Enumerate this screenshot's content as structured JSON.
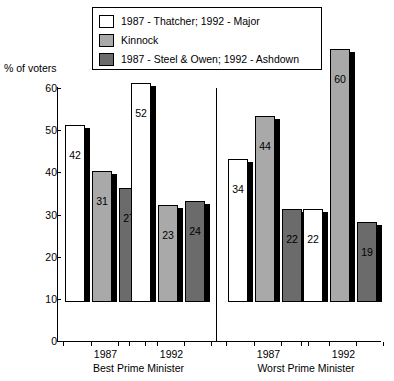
{
  "chart_data": {
    "type": "bar",
    "title": "",
    "subtitle": "",
    "xlabel": "",
    "ylabel": "% of voters",
    "ylim": [
      0,
      60
    ],
    "yticks": [
      0,
      10,
      20,
      30,
      40,
      50,
      60
    ],
    "grid": false,
    "legend_position": "top",
    "legend": [
      {
        "label": "1987 - Thatcher; 1992 - Major",
        "color": "#ffffff",
        "swatch": "sw-white"
      },
      {
        "label": "Kinnock",
        "color": "#a9a9a9",
        "swatch": "sw-light"
      },
      {
        "label": "1987 - Steel & Owen; 1992 - Ashdown",
        "color": "#6b6b6b",
        "swatch": "sw-dark"
      }
    ],
    "series": [
      {
        "name": "1987 - Thatcher; 1992 - Major",
        "values": [
          42,
          52,
          34,
          22
        ]
      },
      {
        "name": "Kinnock",
        "values": [
          31,
          23,
          44,
          60
        ]
      },
      {
        "name": "1987 - Steel & Owen; 1992 - Ashdown",
        "values": [
          27,
          24,
          22,
          19
        ]
      }
    ],
    "panels": [
      {
        "label": "Best Prime Minister",
        "groups": [
          {
            "label": "1987",
            "bars": [
              {
                "series": "1987 - Thatcher; 1992 - Major",
                "value": 42,
                "swatch": "c-white"
              },
              {
                "series": "Kinnock",
                "value": 31,
                "swatch": "c-light"
              },
              {
                "series": "1987 - Steel & Owen; 1992 - Ashdown",
                "value": 27,
                "swatch": "c-dark"
              }
            ]
          },
          {
            "label": "1992",
            "bars": [
              {
                "series": "1987 - Thatcher; 1992 - Major",
                "value": 52,
                "swatch": "c-white"
              },
              {
                "series": "Kinnock",
                "value": 23,
                "swatch": "c-light"
              },
              {
                "series": "1987 - Steel & Owen; 1992 - Ashdown",
                "value": 24,
                "swatch": "c-dark"
              }
            ]
          }
        ]
      },
      {
        "label": "Worst Prime Minister",
        "groups": [
          {
            "label": "1987",
            "bars": [
              {
                "series": "1987 - Thatcher; 1992 - Major",
                "value": 34,
                "swatch": "c-white"
              },
              {
                "series": "Kinnock",
                "value": 44,
                "swatch": "c-light"
              },
              {
                "series": "1987 - Steel & Owen; 1992 - Ashdown",
                "value": 22,
                "swatch": "c-dark"
              }
            ]
          },
          {
            "label": "1992",
            "bars": [
              {
                "series": "1987 - Thatcher; 1992 - Major",
                "value": 22,
                "swatch": "c-white"
              },
              {
                "series": "Kinnock",
                "value": 60,
                "swatch": "c-light"
              },
              {
                "series": "1987 - Steel & Owen; 1992 - Ashdown",
                "value": 19,
                "swatch": "c-dark"
              }
            ]
          }
        ]
      }
    ]
  }
}
